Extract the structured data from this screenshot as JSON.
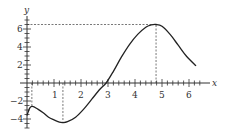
{
  "chart_data": {
    "type": "line",
    "title": "",
    "xlabel": "x",
    "ylabel": "y",
    "xlim": [
      0,
      6.5
    ],
    "ylim": [
      -5,
      7
    ],
    "grid": false,
    "x_ticks": [
      1,
      2,
      3,
      4,
      5,
      6
    ],
    "y_ticks": [
      -4,
      -2,
      2,
      4,
      6
    ],
    "series": [
      {
        "name": "f(x)",
        "x": [
          0,
          0.1,
          0.2,
          0.4,
          0.6,
          0.8,
          1.0,
          1.2,
          1.33,
          1.5,
          1.8,
          2.1,
          2.4,
          2.7,
          2.93,
          3.2,
          3.5,
          3.8,
          4.1,
          4.4,
          4.6,
          4.78,
          5.0,
          5.3,
          5.6,
          5.9,
          6.26
        ],
        "y": [
          -3.6,
          -2.8,
          -2.6,
          -2.9,
          -3.3,
          -3.8,
          -4.1,
          -4.35,
          -4.4,
          -4.3,
          -3.8,
          -2.9,
          -1.8,
          -0.7,
          0,
          1.3,
          2.9,
          4.3,
          5.4,
          6.2,
          6.45,
          6.5,
          6.3,
          5.4,
          4.2,
          3.0,
          1.9
        ]
      }
    ],
    "annotations": [
      {
        "type": "dashed-vertical",
        "x": 0.18,
        "from_y": 0,
        "to_y": -2.6
      },
      {
        "type": "dashed-vertical",
        "x": 1.33,
        "from_y": 0,
        "to_y": -4.4
      },
      {
        "type": "dashed-vertical",
        "x": 4.78,
        "from_y": 0,
        "to_y": 6.5
      },
      {
        "type": "dashed-horizontal",
        "y": 6.5,
        "from_x": 0,
        "to_x": 4.78
      }
    ]
  },
  "labels": {
    "x_axis": "x",
    "y_axis": "y",
    "x_ticks": [
      "1",
      "2",
      "3",
      "4",
      "5",
      "6"
    ],
    "y_ticks_pos": [
      "2",
      "4",
      "6"
    ],
    "y_ticks_neg": [
      "−2",
      "−4"
    ]
  }
}
